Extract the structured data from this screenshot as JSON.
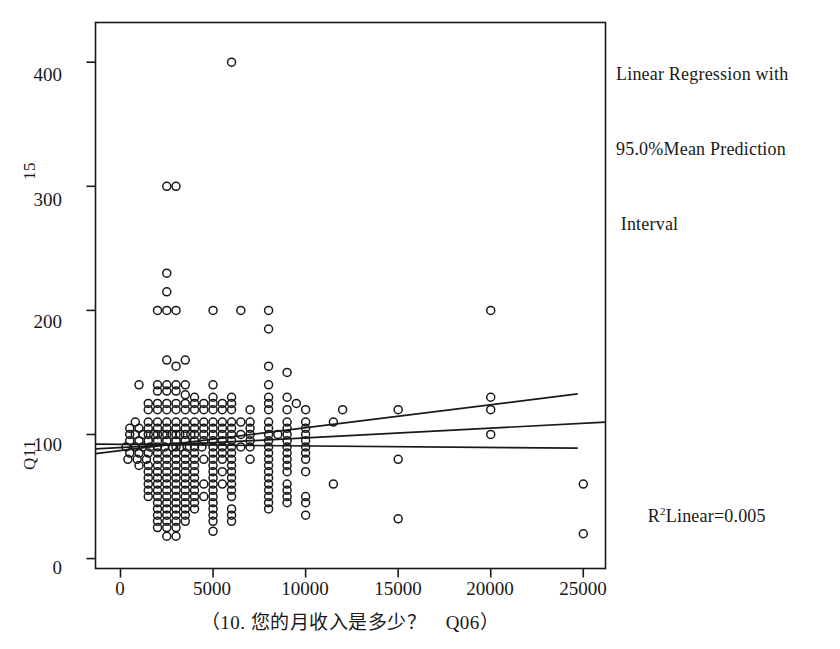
{
  "figure": {
    "kind": "scatterplot-with-regression",
    "background_color": "#ffffff",
    "ink_color": "#191919"
  },
  "annotations": {
    "legend_line_1": "Linear Regression with",
    "legend_line_2": "95.0%Mean Prediction",
    "legend_line_3": " Interval",
    "r2_prefix": "R",
    "r2_superscript": "2",
    "r2_text": "Linear=0.005",
    "bottom_caption": " "
  },
  "axes": {
    "y_axis_label_upper": "15",
    "y_axis_label_lower": "Q11",
    "x_axis_title": "（10. 您的月收入是多少？　Q06）",
    "x_ticks": [
      "0",
      "5000",
      "10000",
      "15000",
      "20000",
      "25000"
    ],
    "y_ticks": [
      "0",
      "100",
      "200",
      "300",
      "400"
    ]
  },
  "chart_data": {
    "type": "scatter",
    "title": "",
    "xlabel": "（10. 您的月收入是多少？　Q06）",
    "ylabel": "Q11",
    "xlim": [
      -1350,
      26200
    ],
    "ylim": [
      -8,
      432
    ],
    "xticks": [
      0,
      5000,
      10000,
      15000,
      20000,
      25000
    ],
    "yticks": [
      0,
      100,
      200,
      300,
      400
    ],
    "grid": false,
    "legend": {
      "position": "outside-top-right",
      "text": "Linear Regression with 95.0%Mean Prediction Interval"
    },
    "fit": {
      "r_squared": 0.005,
      "label": "R²Linear=0.005",
      "line_type": "linear-regression",
      "intercept": 89.5,
      "slope": 0.00078,
      "ci_upper_intercept": 87.0,
      "ci_upper_slope": 0.00185,
      "ci_lower_intercept": 92.0,
      "ci_lower_slope": -0.00012,
      "ci_level": 95.0,
      "ci_kind": "mean prediction interval",
      "center_line_x_range": [
        -1350,
        26200
      ],
      "ci_line_x_range": [
        -1350,
        24700
      ]
    },
    "marker": {
      "style": "open-circle",
      "diameter_px": 8,
      "edge_color": "#191919",
      "fill": "none"
    },
    "points": [
      [
        6000,
        400
      ],
      [
        2500,
        300
      ],
      [
        3000,
        300
      ],
      [
        2500,
        230
      ],
      [
        2500,
        215
      ],
      [
        2000,
        200
      ],
      [
        2500,
        200
      ],
      [
        3000,
        200
      ],
      [
        5000,
        200
      ],
      [
        6500,
        200
      ],
      [
        8000,
        200
      ],
      [
        8000,
        185
      ],
      [
        20000,
        200
      ],
      [
        2500,
        160
      ],
      [
        3500,
        160
      ],
      [
        3000,
        155
      ],
      [
        8000,
        155
      ],
      [
        9000,
        150
      ],
      [
        1000,
        140
      ],
      [
        2000,
        140
      ],
      [
        2500,
        140
      ],
      [
        3000,
        140
      ],
      [
        3500,
        140
      ],
      [
        5000,
        140
      ],
      [
        8000,
        140
      ],
      [
        2000,
        135
      ],
      [
        2500,
        135
      ],
      [
        3000,
        135
      ],
      [
        3500,
        132
      ],
      [
        4000,
        130
      ],
      [
        5000,
        130
      ],
      [
        6000,
        130
      ],
      [
        8000,
        130
      ],
      [
        9000,
        130
      ],
      [
        20000,
        130
      ],
      [
        1500,
        125
      ],
      [
        2000,
        125
      ],
      [
        2500,
        125
      ],
      [
        3000,
        125
      ],
      [
        3500,
        125
      ],
      [
        4000,
        125
      ],
      [
        4500,
        125
      ],
      [
        5000,
        125
      ],
      [
        5500,
        125
      ],
      [
        6000,
        125
      ],
      [
        8000,
        125
      ],
      [
        9500,
        125
      ],
      [
        12000,
        120
      ],
      [
        15000,
        120
      ],
      [
        20000,
        120
      ],
      [
        1500,
        120
      ],
      [
        2000,
        120
      ],
      [
        2500,
        120
      ],
      [
        3000,
        120
      ],
      [
        3500,
        120
      ],
      [
        4000,
        120
      ],
      [
        4500,
        120
      ],
      [
        5000,
        120
      ],
      [
        5500,
        120
      ],
      [
        6000,
        120
      ],
      [
        7000,
        120
      ],
      [
        8000,
        120
      ],
      [
        9000,
        120
      ],
      [
        10000,
        120
      ],
      [
        800,
        110
      ],
      [
        1500,
        110
      ],
      [
        2000,
        110
      ],
      [
        2500,
        110
      ],
      [
        3000,
        110
      ],
      [
        3500,
        110
      ],
      [
        4000,
        110
      ],
      [
        4500,
        110
      ],
      [
        5000,
        110
      ],
      [
        5500,
        110
      ],
      [
        6000,
        110
      ],
      [
        6500,
        110
      ],
      [
        7000,
        110
      ],
      [
        8000,
        110
      ],
      [
        9000,
        110
      ],
      [
        10000,
        110
      ],
      [
        11500,
        110
      ],
      [
        500,
        105
      ],
      [
        1000,
        105
      ],
      [
        1500,
        105
      ],
      [
        2000,
        105
      ],
      [
        2500,
        105
      ],
      [
        3000,
        105
      ],
      [
        3500,
        105
      ],
      [
        4000,
        105
      ],
      [
        4500,
        105
      ],
      [
        5000,
        105
      ],
      [
        5500,
        105
      ],
      [
        6000,
        105
      ],
      [
        7000,
        105
      ],
      [
        8000,
        105
      ],
      [
        9000,
        105
      ],
      [
        10000,
        105
      ],
      [
        500,
        100
      ],
      [
        800,
        100
      ],
      [
        1200,
        100
      ],
      [
        1500,
        100
      ],
      [
        1800,
        100
      ],
      [
        2000,
        100
      ],
      [
        2300,
        100
      ],
      [
        2500,
        100
      ],
      [
        2800,
        100
      ],
      [
        3000,
        100
      ],
      [
        3200,
        100
      ],
      [
        3500,
        100
      ],
      [
        3800,
        100
      ],
      [
        4000,
        100
      ],
      [
        4500,
        100
      ],
      [
        5000,
        100
      ],
      [
        5500,
        100
      ],
      [
        6000,
        100
      ],
      [
        6500,
        100
      ],
      [
        7000,
        100
      ],
      [
        8000,
        100
      ],
      [
        8500,
        100
      ],
      [
        9000,
        100
      ],
      [
        10000,
        100
      ],
      [
        20000,
        100
      ],
      [
        500,
        95
      ],
      [
        1000,
        95
      ],
      [
        1500,
        95
      ],
      [
        2000,
        95
      ],
      [
        2500,
        95
      ],
      [
        3000,
        95
      ],
      [
        3500,
        95
      ],
      [
        4000,
        95
      ],
      [
        4500,
        95
      ],
      [
        5000,
        95
      ],
      [
        5500,
        95
      ],
      [
        6000,
        95
      ],
      [
        7000,
        95
      ],
      [
        8000,
        95
      ],
      [
        9000,
        95
      ],
      [
        10000,
        95
      ],
      [
        300,
        90
      ],
      [
        800,
        90
      ],
      [
        1200,
        90
      ],
      [
        1600,
        90
      ],
      [
        2000,
        90
      ],
      [
        2400,
        90
      ],
      [
        2800,
        90
      ],
      [
        3000,
        90
      ],
      [
        3300,
        90
      ],
      [
        3600,
        90
      ],
      [
        4000,
        90
      ],
      [
        4400,
        90
      ],
      [
        5000,
        90
      ],
      [
        5500,
        90
      ],
      [
        6000,
        90
      ],
      [
        6500,
        90
      ],
      [
        7000,
        90
      ],
      [
        8000,
        90
      ],
      [
        9000,
        90
      ],
      [
        10000,
        90
      ],
      [
        500,
        85
      ],
      [
        1000,
        85
      ],
      [
        1500,
        85
      ],
      [
        2000,
        85
      ],
      [
        2500,
        85
      ],
      [
        3000,
        85
      ],
      [
        3500,
        85
      ],
      [
        4000,
        85
      ],
      [
        5000,
        85
      ],
      [
        5500,
        85
      ],
      [
        6000,
        85
      ],
      [
        8000,
        85
      ],
      [
        9000,
        85
      ],
      [
        10000,
        85
      ],
      [
        15000,
        80
      ],
      [
        400,
        80
      ],
      [
        900,
        80
      ],
      [
        1400,
        80
      ],
      [
        2000,
        80
      ],
      [
        2500,
        80
      ],
      [
        3000,
        80
      ],
      [
        3500,
        80
      ],
      [
        4000,
        80
      ],
      [
        4500,
        80
      ],
      [
        5000,
        80
      ],
      [
        5500,
        80
      ],
      [
        6000,
        80
      ],
      [
        7000,
        80
      ],
      [
        8000,
        80
      ],
      [
        9000,
        80
      ],
      [
        10000,
        80
      ],
      [
        1000,
        75
      ],
      [
        1500,
        75
      ],
      [
        2000,
        75
      ],
      [
        2500,
        75
      ],
      [
        3000,
        75
      ],
      [
        3500,
        75
      ],
      [
        4000,
        75
      ],
      [
        5000,
        75
      ],
      [
        6000,
        75
      ],
      [
        8000,
        75
      ],
      [
        9000,
        75
      ],
      [
        1500,
        70
      ],
      [
        2000,
        70
      ],
      [
        2500,
        70
      ],
      [
        3000,
        70
      ],
      [
        3500,
        70
      ],
      [
        4000,
        70
      ],
      [
        5000,
        70
      ],
      [
        5500,
        70
      ],
      [
        6000,
        70
      ],
      [
        8000,
        70
      ],
      [
        9000,
        70
      ],
      [
        10000,
        70
      ],
      [
        1500,
        65
      ],
      [
        2000,
        65
      ],
      [
        2500,
        65
      ],
      [
        3000,
        65
      ],
      [
        3500,
        65
      ],
      [
        4000,
        65
      ],
      [
        5000,
        65
      ],
      [
        6000,
        65
      ],
      [
        8000,
        65
      ],
      [
        25000,
        60
      ],
      [
        1500,
        60
      ],
      [
        2000,
        60
      ],
      [
        2500,
        60
      ],
      [
        3000,
        60
      ],
      [
        3500,
        60
      ],
      [
        4000,
        60
      ],
      [
        4500,
        60
      ],
      [
        5000,
        60
      ],
      [
        5500,
        60
      ],
      [
        6000,
        60
      ],
      [
        8000,
        60
      ],
      [
        9000,
        60
      ],
      [
        11500,
        60
      ],
      [
        1500,
        55
      ],
      [
        2000,
        55
      ],
      [
        2500,
        55
      ],
      [
        3000,
        55
      ],
      [
        3500,
        55
      ],
      [
        4000,
        55
      ],
      [
        5000,
        55
      ],
      [
        6000,
        55
      ],
      [
        8000,
        55
      ],
      [
        9000,
        55
      ],
      [
        1500,
        50
      ],
      [
        2000,
        50
      ],
      [
        2500,
        50
      ],
      [
        3000,
        50
      ],
      [
        3500,
        50
      ],
      [
        4000,
        50
      ],
      [
        4500,
        50
      ],
      [
        5000,
        50
      ],
      [
        6000,
        50
      ],
      [
        8000,
        50
      ],
      [
        9000,
        50
      ],
      [
        10000,
        50
      ],
      [
        2000,
        45
      ],
      [
        2500,
        45
      ],
      [
        3000,
        45
      ],
      [
        3500,
        45
      ],
      [
        4000,
        45
      ],
      [
        5000,
        45
      ],
      [
        8000,
        45
      ],
      [
        9000,
        45
      ],
      [
        10000,
        45
      ],
      [
        15000,
        32
      ],
      [
        2000,
        40
      ],
      [
        2500,
        40
      ],
      [
        3000,
        40
      ],
      [
        3500,
        40
      ],
      [
        4000,
        40
      ],
      [
        5000,
        40
      ],
      [
        6000,
        40
      ],
      [
        8000,
        40
      ],
      [
        2000,
        35
      ],
      [
        2500,
        35
      ],
      [
        3000,
        35
      ],
      [
        3500,
        35
      ],
      [
        5000,
        35
      ],
      [
        6000,
        35
      ],
      [
        10000,
        35
      ],
      [
        2000,
        30
      ],
      [
        2500,
        30
      ],
      [
        3000,
        30
      ],
      [
        3500,
        30
      ],
      [
        5000,
        30
      ],
      [
        6000,
        30
      ],
      [
        2000,
        25
      ],
      [
        2500,
        25
      ],
      [
        3000,
        25
      ],
      [
        5000,
        22
      ],
      [
        25000,
        20
      ],
      [
        2500,
        18
      ],
      [
        3000,
        18
      ]
    ]
  }
}
